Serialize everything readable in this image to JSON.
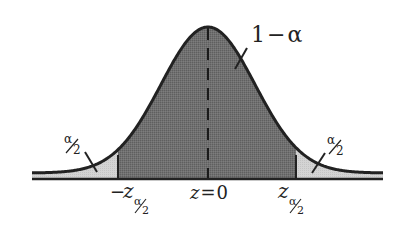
{
  "diagram": {
    "type": "normal-distribution-two-tailed",
    "center_label": "z = 0",
    "center_label_parts": {
      "var": "z",
      "eq": "=",
      "val": "0"
    },
    "center_area_label": "1 − α",
    "center_area_parts": {
      "one": "1",
      "minus": "−",
      "alpha": "α"
    },
    "left_tail_label": {
      "num": "α",
      "den": "2"
    },
    "right_tail_label": {
      "num": "α",
      "den": "2"
    },
    "left_critical": {
      "sign": "−",
      "var": "z",
      "sub_num": "α",
      "sub_den": "2"
    },
    "right_critical": {
      "var": "z",
      "sub_num": "α",
      "sub_den": "2"
    },
    "colors": {
      "curve": "#222222",
      "center_fill": "#6e6e6e",
      "tail_fill": "#d2d2d2",
      "background": "#ffffff"
    }
  },
  "chart_data": {
    "type": "area",
    "title": "",
    "xlabel": "z",
    "ylabel": "",
    "distribution": "standard normal",
    "regions": [
      {
        "name": "left tail",
        "range": [
          "-inf",
          "-z_{α/2}"
        ],
        "area": "α/2",
        "fill": "light"
      },
      {
        "name": "center",
        "range": [
          "-z_{α/2}",
          "z_{α/2}"
        ],
        "area": "1-α",
        "fill": "dark"
      },
      {
        "name": "right tail",
        "range": [
          "z_{α/2}",
          "inf"
        ],
        "area": "α/2",
        "fill": "light"
      }
    ],
    "tick_labels": [
      "-z_{α/2}",
      "z = 0",
      "z_{α/2}"
    ],
    "annotations": [
      "1-α",
      "α/2",
      "α/2"
    ],
    "mean_line": {
      "x": 0,
      "style": "dashed"
    }
  }
}
